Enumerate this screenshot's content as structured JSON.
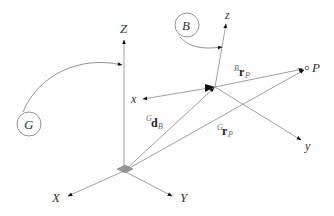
{
  "diagram": {
    "global_frame": {
      "name": "G",
      "axes": {
        "X": "X",
        "Y": "Y",
        "Z": "Z"
      }
    },
    "body_frame": {
      "name": "B",
      "axes": {
        "x": "x",
        "y": "y",
        "z": "z"
      }
    },
    "point": "P",
    "vectors": {
      "d_B": {
        "sup": "G",
        "main": "d",
        "sub": "B"
      },
      "rP_G": {
        "sup": "G",
        "main": "r",
        "sub": "P"
      },
      "rP_B": {
        "sup": "B",
        "main": "r",
        "sub": "P"
      }
    },
    "colors": {
      "line": "#777777",
      "text": "#333333",
      "origin_fill": "#999999"
    }
  }
}
